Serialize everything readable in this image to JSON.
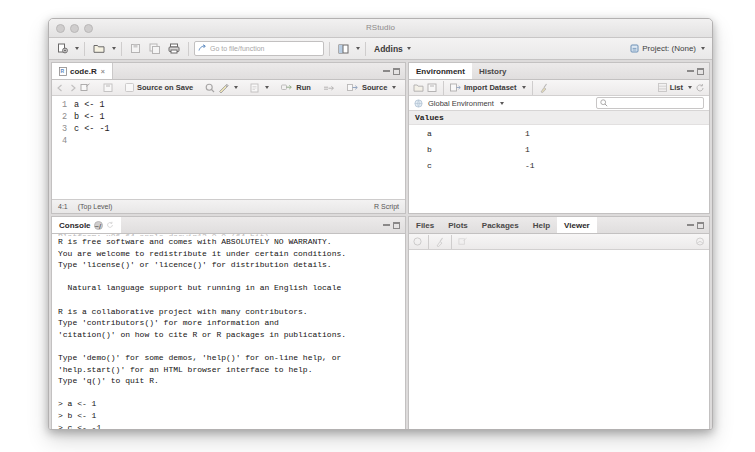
{
  "window": {
    "title": "RStudio",
    "traffic_lights": [
      "close-button",
      "minimize-button",
      "zoom-button"
    ]
  },
  "toolbar": {
    "new_file_label": "new-file-icon",
    "open_file_label": "open-file-icon",
    "save_label": "save-icon",
    "save_all_label": "save-all-icon",
    "print_label": "print-icon",
    "goto_placeholder": "Go to file/function",
    "workspace_panes_label": "workspace-panes-icon",
    "addins_label": "Addins",
    "project_label": "Project: (None)"
  },
  "source_pane": {
    "tab_label": "code.R",
    "tab_close": "×",
    "tools": {
      "back_label": "back-icon",
      "forward_label": "forward-icon",
      "show_doc_outline_label": "show-in-new-window-icon",
      "save_label": "save-icon",
      "source_on_save_label": "Source on Save",
      "find_label": "find-icon",
      "code_tools_label": "code-tools-icon",
      "compile_report_label": "compile-report-icon",
      "run_label": "Run",
      "rerun_label": "rerun-icon",
      "source_label": "Source",
      "outline_label": "document-outline-icon"
    },
    "lines": [
      {
        "n": "1",
        "text": "a <- 1"
      },
      {
        "n": "2",
        "text": "b <- 1"
      },
      {
        "n": "3",
        "text": "c <- -1"
      },
      {
        "n": "4",
        "text": ""
      }
    ],
    "status": {
      "cursor": "4:1",
      "scope": "(Top Level)",
      "filetype": "R Script"
    }
  },
  "environment_pane": {
    "tabs": [
      {
        "label": "Environment",
        "active": true
      },
      {
        "label": "History",
        "active": false
      }
    ],
    "tools": {
      "load_label": "load-workspace-icon",
      "save_label": "save-workspace-icon",
      "import_dataset_label": "Import Dataset",
      "clear_label": "broom-clear-icon",
      "grid_label": "grid-icon",
      "list_label": "List",
      "refresh_label": "refresh-icon"
    },
    "scope_label": "Global Environment",
    "search_placeholder": "",
    "sections": [
      {
        "title": "Values",
        "rows": [
          {
            "name": "a",
            "value": "1"
          },
          {
            "name": "b",
            "value": "1"
          },
          {
            "name": "c",
            "value": "-1"
          }
        ]
      }
    ]
  },
  "console_pane": {
    "tab_label": "Console",
    "path_label": "~/",
    "refresh_label": "refresh-icon",
    "clipped_line": "Platform: x86_64-apple-darwin13.0.0 (64-bit)",
    "lines": [
      "R is free software and comes with ABSOLUTELY NO WARRANTY.",
      "You are welcome to redistribute it under certain conditions.",
      "Type 'license()' or 'licence()' for distribution details.",
      "",
      "  Natural language support but running in an English locale",
      "",
      "R is a collaborative project with many contributors.",
      "Type 'contributors()' for more information and",
      "'citation()' on how to cite R or R packages in publications.",
      "",
      "Type 'demo()' for some demos, 'help()' for on-line help, or",
      "'help.start()' for an HTML browser interface to help.",
      "Type 'q()' to quit R.",
      "",
      "> a <- 1",
      "> b <- 1",
      "> c <- -1"
    ],
    "prompt": ">"
  },
  "files_pane": {
    "tabs": [
      {
        "label": "Files",
        "active": false
      },
      {
        "label": "Plots",
        "active": false
      },
      {
        "label": "Packages",
        "active": false
      },
      {
        "label": "Help",
        "active": false
      },
      {
        "label": "Viewer",
        "active": true
      }
    ],
    "tools": {
      "stop_label": "stop-icon",
      "clear_label": "broom-clear-icon",
      "popout_label": "popout-icon",
      "publish_label": "publish-icon"
    }
  },
  "colors": {
    "window_bg": "#f0efef",
    "pane_bg": "#ffffff",
    "border": "#c3c1c1",
    "text": "#1d1b1b",
    "muted": "#8d8b8b"
  }
}
